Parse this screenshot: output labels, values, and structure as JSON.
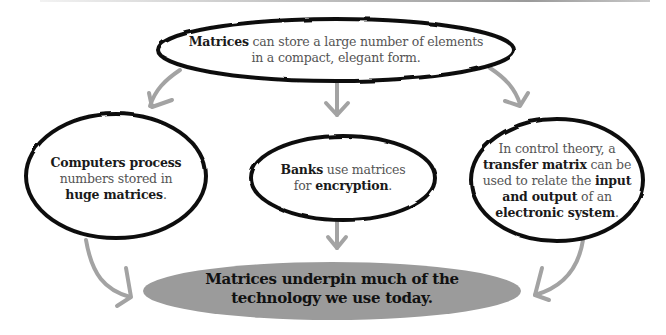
{
  "diagram": {
    "top_bubble": {
      "parts": [
        {
          "text": "Matrices",
          "bold": true
        },
        {
          "text": " can store a large number of elements",
          "bold": false
        },
        {
          "text": "in a compact, elegant form.",
          "bold": false
        }
      ]
    },
    "left_bubble": {
      "line1": "Computers process",
      "line2": "numbers stored in",
      "line3_bold": "huge matrices",
      "line3_end": "."
    },
    "middle_bubble": {
      "line1_bold": "Banks",
      "line1_rest": " use matrices",
      "line2_start": "for ",
      "line2_bold": "encryption",
      "line2_end": "."
    },
    "right_bubble": {
      "line1": "In control theory, a",
      "line2_bold": "transfer matrix",
      "line2_rest": " can be",
      "line3_start": "used to relate the ",
      "line3_bold": "input",
      "line4_bold": "and output",
      "line4_rest": " of an",
      "line5_bold": "electronic system",
      "line5_end": "."
    },
    "conclusion": {
      "line1": "Matrices underpin much of the",
      "line2": "technology we use today."
    },
    "colors": {
      "bubble_outline": "#111111",
      "arrow": "#a0a0a0",
      "conclusion_fill": "#9b9b9b",
      "bold_text": "#1a1a1a",
      "regular_text": "#555555"
    }
  }
}
